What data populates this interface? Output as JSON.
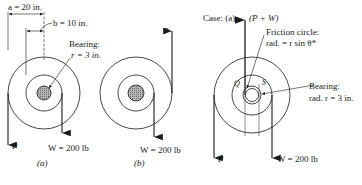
{
  "figure": {
    "panel_a": {
      "dim_a": "a = 20 in.",
      "dim_b": "b = 10 in.",
      "bearing_title": "Bearing:",
      "bearing_value": "r = 3 in.",
      "force_p": "P",
      "force_w": "W = 200 lb",
      "caption": "(a)"
    },
    "panel_b": {
      "force_p": "P",
      "force_w": "W = 200 lb",
      "caption": "(b)"
    },
    "panel_case": {
      "case_label": "Case: (a)",
      "force_sum": "(P + W)",
      "friction_title": "Friction circle:",
      "friction_value": "rad. = r sin θ*",
      "point_q": "Q",
      "point_s": "S",
      "bearing_title": "Bearing:",
      "bearing_value": "rad. r = 3 in.",
      "force_p": "P",
      "force_w": "W = 200 lb"
    }
  },
  "colors": {
    "ink": "#1a1a1a",
    "hub_fill": "#9a9a9a",
    "background": "#ffffff"
  }
}
